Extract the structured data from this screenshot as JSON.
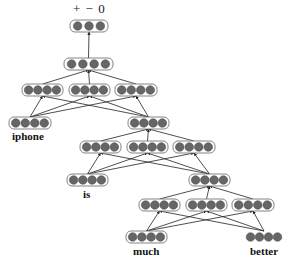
{
  "output_label": "+ − 0",
  "words": {
    "w1": "iphone",
    "w2": "is",
    "w3": "much",
    "w4": "better"
  },
  "colors": {
    "node_fill": "#666666",
    "node_stroke": "#444444",
    "box_stroke": "#777777",
    "edge": "#222222"
  },
  "nodes": [
    {
      "id": "out",
      "x": 70,
      "y": 20,
      "w": 38,
      "n": 3,
      "box": true
    },
    {
      "id": "root",
      "x": 64,
      "y": 58,
      "w": 49,
      "n": 4,
      "box": true
    },
    {
      "id": "r_a",
      "x": 22,
      "y": 84,
      "w": 41,
      "n": 4,
      "box": true
    },
    {
      "id": "r_b",
      "x": 69,
      "y": 84,
      "w": 41,
      "n": 4,
      "box": true
    },
    {
      "id": "r_c",
      "x": 115,
      "y": 84,
      "w": 42,
      "n": 4,
      "box": true
    },
    {
      "id": "iphone",
      "x": 9,
      "y": 117,
      "w": 42,
      "n": 4,
      "box": true
    },
    {
      "id": "p1",
      "x": 128,
      "y": 117,
      "w": 41,
      "n": 4,
      "box": true
    },
    {
      "id": "p1_a",
      "x": 80,
      "y": 141,
      "w": 41,
      "n": 4,
      "box": true
    },
    {
      "id": "p1_b",
      "x": 127,
      "y": 141,
      "w": 41,
      "n": 4,
      "box": true
    },
    {
      "id": "p1_c",
      "x": 173,
      "y": 141,
      "w": 42,
      "n": 4,
      "box": true
    },
    {
      "id": "is",
      "x": 67,
      "y": 174,
      "w": 41,
      "n": 4,
      "box": true
    },
    {
      "id": "p2",
      "x": 189,
      "y": 174,
      "w": 41,
      "n": 4,
      "box": true
    },
    {
      "id": "p2_a",
      "x": 139,
      "y": 199,
      "w": 41,
      "n": 4,
      "box": true
    },
    {
      "id": "p2_b",
      "x": 186,
      "y": 199,
      "w": 41,
      "n": 4,
      "box": true
    },
    {
      "id": "p2_c",
      "x": 232,
      "y": 199,
      "w": 42,
      "n": 4,
      "box": true
    },
    {
      "id": "much",
      "x": 126,
      "y": 231,
      "w": 41,
      "n": 4,
      "box": true
    },
    {
      "id": "better",
      "x": 244,
      "y": 231,
      "w": 40,
      "n": 4,
      "box": false
    }
  ],
  "edges": [
    [
      "root",
      "out"
    ],
    [
      "r_a",
      "root"
    ],
    [
      "r_b",
      "root"
    ],
    [
      "r_c",
      "root"
    ],
    [
      "iphone",
      "r_a"
    ],
    [
      "iphone",
      "r_b"
    ],
    [
      "iphone",
      "r_c"
    ],
    [
      "p1",
      "r_a"
    ],
    [
      "p1",
      "r_b"
    ],
    [
      "p1",
      "r_c"
    ],
    [
      "p1_a",
      "p1"
    ],
    [
      "p1_b",
      "p1"
    ],
    [
      "p1_c",
      "p1"
    ],
    [
      "is",
      "p1_a"
    ],
    [
      "is",
      "p1_b"
    ],
    [
      "is",
      "p1_c"
    ],
    [
      "p2",
      "p1_a"
    ],
    [
      "p2",
      "p1_b"
    ],
    [
      "p2",
      "p1_c"
    ],
    [
      "p2_a",
      "p2"
    ],
    [
      "p2_b",
      "p2"
    ],
    [
      "p2_c",
      "p2"
    ],
    [
      "much",
      "p2_a"
    ],
    [
      "much",
      "p2_b"
    ],
    [
      "much",
      "p2_c"
    ],
    [
      "better",
      "p2_a"
    ],
    [
      "better",
      "p2_b"
    ],
    [
      "better",
      "p2_c"
    ]
  ]
}
